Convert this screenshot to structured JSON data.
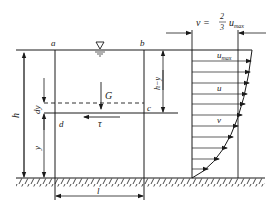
{
  "diagram": {
    "type": "fluid-flow-free-body-diagram",
    "labels": {
      "point_a": "a",
      "point_b": "b",
      "point_c": "c",
      "point_d": "d",
      "gravity": "G",
      "shear_stress": "τ",
      "depth": "h",
      "height_y": "y",
      "depth_minus_y": "h−y",
      "layer_thickness": "dy",
      "length": "l",
      "velocity_u": "u",
      "velocity_v": "v",
      "u_max_base": "u",
      "u_max_sub": "max",
      "mean_velocity_lhs": "v =",
      "mean_velocity_num": "2",
      "mean_velocity_den": "3",
      "mean_velocity_u": "u",
      "mean_velocity_sub": "max"
    },
    "symbols": {
      "free_surface": "free-surface-triangle-symbol",
      "channel_bed": "hatched-ground"
    },
    "colors": {
      "line": "#1a1a1a",
      "background": "#ffffff"
    }
  }
}
